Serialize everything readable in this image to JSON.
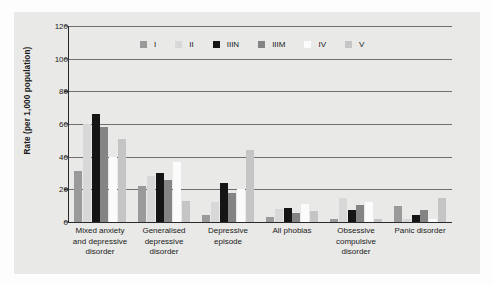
{
  "chart_data": {
    "type": "bar",
    "title": "",
    "xlabel": "",
    "ylabel": "Rate (per 1,000 population)",
    "ylim": [
      0,
      120
    ],
    "yticks": [
      0,
      20,
      40,
      60,
      80,
      100,
      120
    ],
    "grid": true,
    "legend_position": "top-center",
    "categories": [
      "Mixed anxiety and depressive disorder",
      "Generalised depressive disorder",
      "Depressive episode",
      "All phobias",
      "Obsessive compulsive disorder",
      "Panic disorder"
    ],
    "category_lines": [
      [
        "Mixed anxiety",
        "and depressive",
        "disorder"
      ],
      [
        "Generalised",
        "depressive",
        "disorder"
      ],
      [
        "Depressive",
        "episode"
      ],
      [
        "All phobias"
      ],
      [
        "Obsessive",
        "compulsive",
        "disorder"
      ],
      [
        "Panic disorder"
      ]
    ],
    "series": [
      {
        "name": "I",
        "color": "#9a9a9a",
        "values": [
          31,
          22,
          4,
          3,
          2,
          10
        ]
      },
      {
        "name": "II",
        "color": "#d8d8d8",
        "values": [
          60,
          28,
          12,
          8,
          15,
          2
        ]
      },
      {
        "name": "IIIN",
        "color": "#151515",
        "values": [
          66,
          30,
          24,
          8.5,
          7.5,
          4.5
        ]
      },
      {
        "name": "IIIM",
        "color": "#848484",
        "values": [
          58,
          26,
          18,
          5.5,
          10.5,
          7.5
        ]
      },
      {
        "name": "IV",
        "color": "#fbfbfb",
        "values": [
          40,
          37,
          20,
          11,
          12,
          2
        ]
      },
      {
        "name": "V",
        "color": "#c5c5c5",
        "values": [
          51,
          13,
          44,
          7,
          2,
          14.5
        ]
      }
    ]
  },
  "style": {
    "panel_background": "#e9e9e7",
    "figure_background": "#fdfdfd",
    "axis_color": "#2a2a2a",
    "grid_color": "#6e6e6e",
    "text_color": "#1a1a1a"
  }
}
